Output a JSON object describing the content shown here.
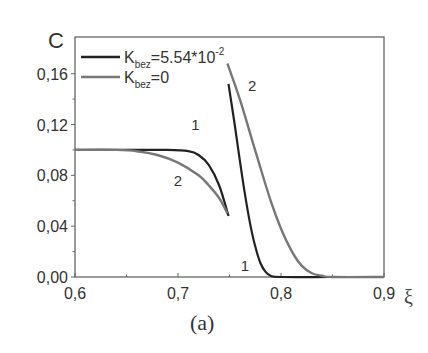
{
  "chart_data": {
    "type": "line",
    "title": "",
    "panel_label": "(a)",
    "xlabel": "ξ",
    "ylabel": "C",
    "xlim": [
      0.6,
      0.9
    ],
    "ylim": [
      0.0,
      0.18
    ],
    "x_ticks": [
      0.6,
      0.7,
      0.8,
      0.9
    ],
    "x_tick_labels": [
      "0,6",
      "0,7",
      "0,8",
      "0,9"
    ],
    "y_ticks": [
      0.0,
      0.04,
      0.08,
      0.12,
      0.16
    ],
    "y_tick_labels": [
      "0,00",
      "0,04",
      "0,08",
      "0,12",
      "0,16"
    ],
    "grid": false,
    "legend_position": "upper left",
    "series": [
      {
        "name": "K_bez=5.54*10^-2",
        "label_main": "K",
        "label_sub": "bez",
        "label_rest": "=5.54*10",
        "label_sup": "-2",
        "curve_number": "1",
        "color": "#222222",
        "x": [
          0.6,
          0.65,
          0.69,
          0.71,
          0.72,
          0.73,
          0.74,
          0.749,
          0.749,
          0.755,
          0.76,
          0.765,
          0.77,
          0.775,
          0.78,
          0.785,
          0.79,
          0.8,
          0.85,
          0.9
        ],
        "y": [
          0.1,
          0.1,
          0.1,
          0.099,
          0.096,
          0.088,
          0.072,
          0.048,
          0.152,
          0.12,
          0.092,
          0.065,
          0.042,
          0.024,
          0.011,
          0.004,
          0.001,
          0.0,
          0.0,
          0.0
        ]
      },
      {
        "name": "K_bez=0",
        "label_main": "K",
        "label_sub": "bez",
        "label_rest": "=0",
        "curve_number": "2",
        "color": "#777777",
        "x": [
          0.6,
          0.64,
          0.66,
          0.68,
          0.7,
          0.72,
          0.73,
          0.74,
          0.748,
          0.748,
          0.76,
          0.77,
          0.78,
          0.79,
          0.8,
          0.81,
          0.82,
          0.83,
          0.84,
          0.85,
          0.9
        ],
        "y": [
          0.1,
          0.1,
          0.099,
          0.096,
          0.09,
          0.08,
          0.072,
          0.062,
          0.05,
          0.168,
          0.14,
          0.113,
          0.086,
          0.06,
          0.038,
          0.021,
          0.009,
          0.003,
          0.001,
          0.0,
          0.0
        ]
      }
    ],
    "annotations": [
      {
        "text": "1",
        "x": 0.717,
        "y": 0.116
      },
      {
        "text": "2",
        "x": 0.7,
        "y": 0.072
      },
      {
        "text": "1",
        "x": 0.765,
        "y": 0.005
      },
      {
        "text": "2",
        "x": 0.772,
        "y": 0.146
      }
    ]
  }
}
